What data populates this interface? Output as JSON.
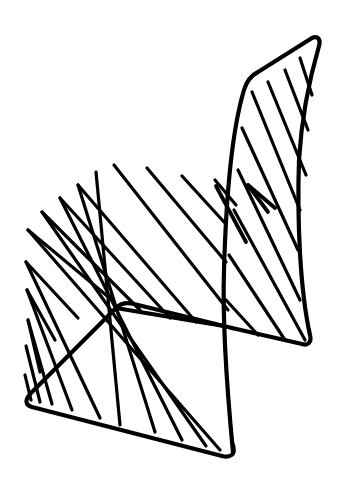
{
  "image": {
    "subject": "wire chair line drawing",
    "width": 346,
    "height": 489,
    "background": "#ffffff",
    "stroke_color": "#000000",
    "frame_width": 4.2,
    "rod_width": 3.2
  },
  "frame": {
    "backrest_outline": "M 233 452 C 228 400 222 330 224 270 C 226 200 232 130 244 90 C 247 80 252 75 258 72 L 312 38 C 318 35 321 40 319 46 C 312 70 302 110 299 160 C 297 220 300 290 310 335 C 312 342 308 346 302 344 L 232 328",
    "seat_back_rail": "M 232 328 L 134 304 C 126 302 120 304 116 308 L 30 394 C 25 400 25 405 32 407 L 222 456 C 230 458 236 455 233 445",
    "front_rail": "M 116 308 L 224 326"
  },
  "rods": {
    "backrest": [
      [
        252,
        92,
        300,
        210
      ],
      [
        268,
        82,
        306,
        175
      ],
      [
        285,
        70,
        308,
        130
      ],
      [
        300,
        58,
        312,
        95
      ],
      [
        242,
        128,
        298,
        250
      ],
      [
        238,
        170,
        300,
        300
      ],
      [
        234,
        210,
        305,
        340
      ],
      [
        229,
        255,
        285,
        340
      ],
      [
        226,
        300,
        258,
        335
      ]
    ],
    "seat": [
      [
        28,
        230,
        220,
        450
      ],
      [
        42,
        212,
        206,
        446
      ],
      [
        60,
        198,
        182,
        440
      ],
      [
        78,
        185,
        155,
        432
      ],
      [
        96,
        172,
        120,
        425
      ],
      [
        114,
        165,
        228,
        310
      ],
      [
        147,
        168,
        226,
        262
      ],
      [
        182,
        176,
        224,
        222
      ],
      [
        215,
        180,
        236,
        205
      ],
      [
        26,
        262,
        100,
        418
      ],
      [
        27,
        290,
        72,
        410
      ],
      [
        28,
        320,
        52,
        404
      ],
      [
        26,
        346,
        40,
        402
      ],
      [
        25,
        375,
        31,
        400
      ]
    ],
    "loops": [
      [
        28,
        230,
        112,
        300
      ],
      [
        42,
        212,
        140,
        310
      ],
      [
        60,
        198,
        170,
        318
      ],
      [
        78,
        185,
        196,
        322
      ],
      [
        26,
        262,
        78,
        318
      ],
      [
        27,
        290,
        55,
        340
      ],
      [
        28,
        320,
        40,
        372
      ]
    ],
    "zigzag": [
      [
        216,
        186,
        246,
        242
      ],
      [
        248,
        185,
        268,
        212
      ],
      [
        248,
        185,
        275,
        208
      ]
    ]
  }
}
